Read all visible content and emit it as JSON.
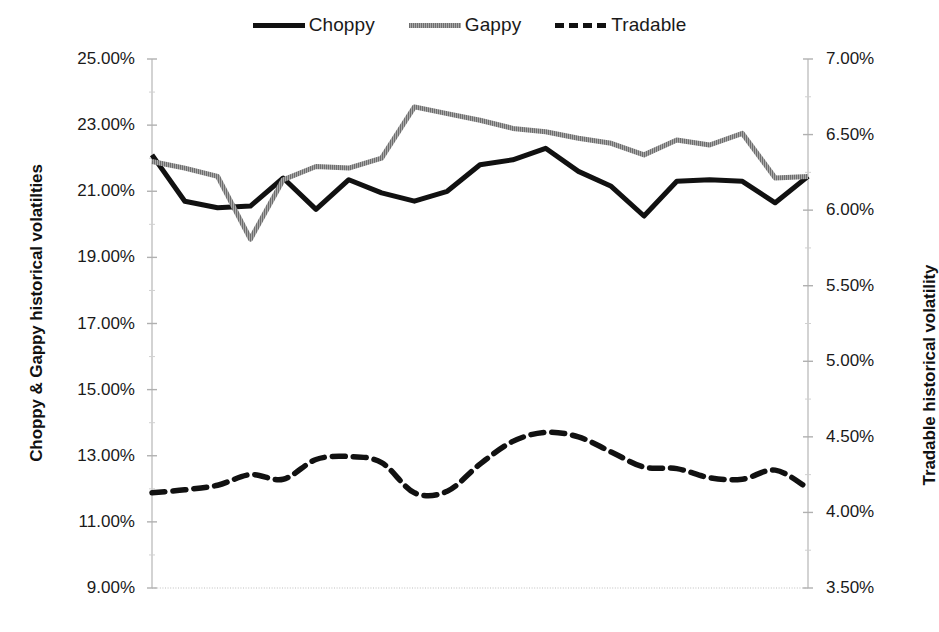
{
  "legend": {
    "position": "top-center",
    "items": [
      {
        "label": "Choppy",
        "swatch": "solid-line-swatch",
        "color": "#111111"
      },
      {
        "label": "Gappy",
        "swatch": "hatched-line-swatch",
        "color": "#8b8b8b"
      },
      {
        "label": "Tradable",
        "swatch": "dashed-line-swatch",
        "color": "#111111"
      }
    ]
  },
  "axes": {
    "left": {
      "title": "Choppy & Gappy historical volatilties",
      "ticks": [
        "25.00%",
        "23.00%",
        "21.00%",
        "19.00%",
        "17.00%",
        "15.00%",
        "13.00%",
        "11.00%",
        "9.00%"
      ],
      "min": 9.0,
      "max": 25.0,
      "step": 2.0
    },
    "right": {
      "title": "Tradable historical volatility",
      "ticks": [
        "7.00%",
        "6.50%",
        "6.00%",
        "5.50%",
        "5.00%",
        "4.50%",
        "4.00%",
        "3.50%"
      ],
      "min": 3.5,
      "max": 7.0,
      "step": 0.5
    },
    "bottom": {
      "title": "",
      "ticks": []
    }
  },
  "chart_data": {
    "type": "line",
    "title": "",
    "xlabel": "",
    "ylabel": "Choppy & Gappy historical volatilties",
    "y2label": "Tradable historical volatility",
    "ylim": [
      9.0,
      25.0
    ],
    "y2lim": [
      3.5,
      7.0
    ],
    "grid": false,
    "legend_position": "top-center",
    "x": [
      1,
      2,
      3,
      4,
      5,
      6,
      7,
      8,
      9,
      10,
      11,
      12,
      13,
      14,
      15,
      16,
      17,
      18,
      19,
      20,
      21
    ],
    "series": [
      {
        "name": "Choppy",
        "axis": "left",
        "style": "solid",
        "color": "#111111",
        "values": [
          22.1,
          20.7,
          20.5,
          20.55,
          21.4,
          20.45,
          21.35,
          20.95,
          20.7,
          21.0,
          21.8,
          21.95,
          22.3,
          21.6,
          21.15,
          20.25,
          21.3,
          21.35,
          21.3,
          20.65,
          21.45
        ]
      },
      {
        "name": "Gappy",
        "axis": "left",
        "style": "hatched",
        "color": "#8b8b8b",
        "values": [
          21.9,
          21.7,
          21.45,
          19.55,
          21.35,
          21.75,
          21.7,
          22.0,
          23.55,
          23.35,
          23.15,
          22.9,
          22.8,
          22.6,
          22.45,
          22.1,
          22.55,
          22.4,
          22.75,
          21.4,
          21.45
        ]
      },
      {
        "name": "Tradable",
        "axis": "right",
        "style": "dashed",
        "color": "#111111",
        "values": [
          4.13,
          4.15,
          4.18,
          4.25,
          4.22,
          4.35,
          4.37,
          4.33,
          4.13,
          4.14,
          4.32,
          4.47,
          4.53,
          4.5,
          4.4,
          4.3,
          4.29,
          4.23,
          4.22,
          4.28,
          4.16
        ]
      }
    ]
  }
}
